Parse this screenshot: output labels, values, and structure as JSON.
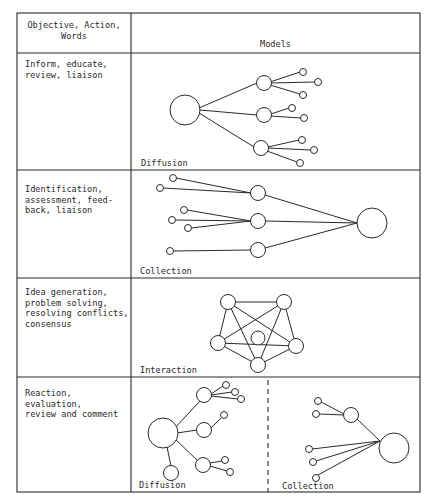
{
  "table": {
    "headers": {
      "objective": "Objective, Action,\nWords",
      "models": "Models"
    },
    "rows": [
      {
        "objective": "Inform, educate,\nreview, liaison",
        "model_labels": [
          "Diffusion"
        ]
      },
      {
        "objective": "Identification,\nassessment, feed-\nback, liaison",
        "model_labels": [
          "Collection"
        ]
      },
      {
        "objective": "Idea generation,\nproblem solving,\nresolving conflicts,\nconsensus",
        "model_labels": [
          "Interaction"
        ]
      },
      {
        "objective": "Reaction,\nevaluation,\nreview and comment",
        "model_labels": [
          "Diffusion",
          "Collection"
        ]
      }
    ]
  },
  "colors": {
    "line": "#2a2a2a",
    "background": "#ffffff"
  }
}
